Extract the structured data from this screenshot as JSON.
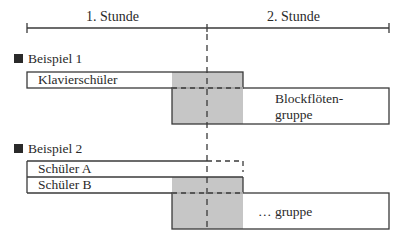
{
  "timeline": {
    "hour1_label": "1. Stunde",
    "hour2_label": "2. Stunde"
  },
  "examples": [
    {
      "title": "Beispiel 1",
      "bars": [
        {
          "label": "Klavierschüler"
        },
        {
          "label_line1": "Blockflöten-",
          "label_line2": "gruppe"
        }
      ]
    },
    {
      "title": "Beispiel 2",
      "bars": [
        {
          "label": "Schüler A"
        },
        {
          "label": "Schüler B"
        },
        {
          "label": "… gruppe"
        }
      ]
    }
  ],
  "colors": {
    "line": "#3a3a3a",
    "overlap_fill": "#c6c6c6",
    "marker": "#2a2a2a"
  }
}
